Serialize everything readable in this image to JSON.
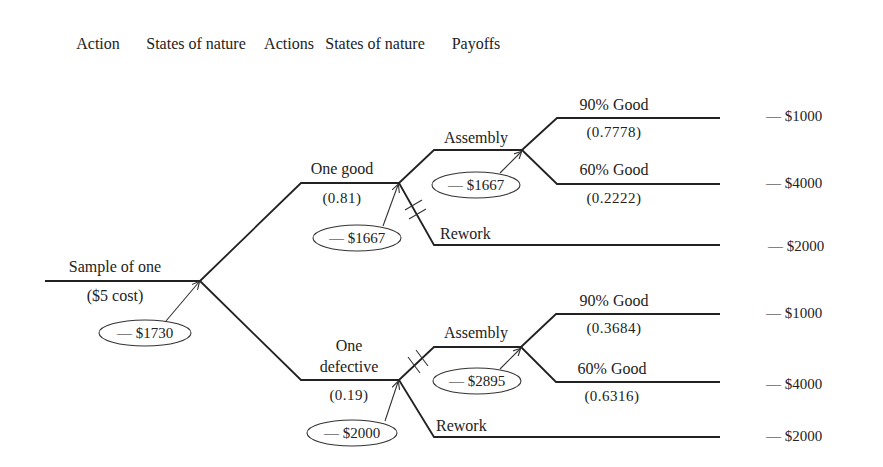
{
  "headers": {
    "col1": "Action",
    "col2": "States of nature",
    "col3": "Actions",
    "col4": "States of nature",
    "col5": "Payoffs"
  },
  "root": {
    "label": "Sample of one",
    "cost": "($5 cost)",
    "expected_value": "— $1730"
  },
  "good_branch": {
    "label": "One good",
    "probability": "(0.81)",
    "expected_value": "— $1667",
    "assembly": {
      "label": "Assembly",
      "expected_value": "— $1667",
      "outcomes": [
        {
          "label": "90% Good",
          "probability": "(0.7778)",
          "payoff": "— $1000"
        },
        {
          "label": "60% Good",
          "probability": "(0.2222)",
          "payoff": "— $4000"
        }
      ]
    },
    "rework": {
      "label": "Rework",
      "payoff": "— $2000",
      "pruned": true
    }
  },
  "defective_branch": {
    "label_line1": "One",
    "label_line2": "defective",
    "probability": "(0.19)",
    "expected_value": "— $2000",
    "assembly": {
      "label": "Assembly",
      "expected_value": "— $2895",
      "pruned": true,
      "outcomes": [
        {
          "label": "90% Good",
          "probability": "(0.3684)",
          "payoff": "— $1000"
        },
        {
          "label": "60% Good",
          "probability": "(0.6316)",
          "payoff": "— $4000"
        }
      ]
    },
    "rework": {
      "label": "Rework",
      "payoff": "— $2000"
    }
  }
}
